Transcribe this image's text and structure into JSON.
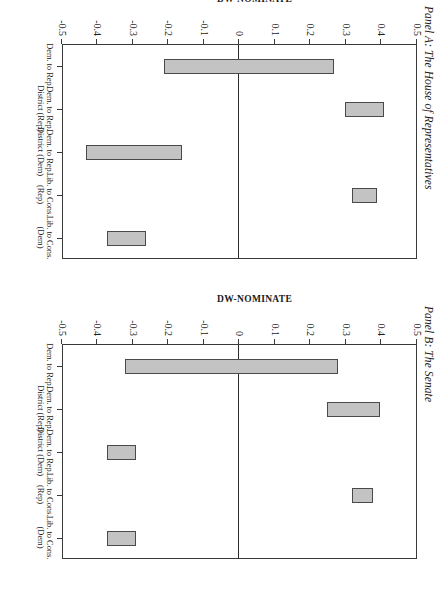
{
  "figure": {
    "axis_title": "DW-NOMINATE",
    "bar_fill_color": "#c3c3c3",
    "bar_border_color": "#4a4a4a",
    "frame_color": "#3a3a3a"
  },
  "chart_data": [
    {
      "type": "bar",
      "title": "Panel A: The House of Representatives",
      "xlabel": "",
      "ylabel": "DW-NOMINATE",
      "ylim": [
        -0.5,
        0.5
      ],
      "yticks": [
        0.5,
        0.4,
        0.3,
        0.2,
        0.1,
        0,
        -0.1,
        -0.2,
        -0.3,
        -0.4,
        -0.5
      ],
      "ytick_labels": [
        "0.5",
        "0.4",
        "0.3",
        "0.2",
        "0.1",
        "0",
        "-0.1",
        "-0.2",
        "-0.3",
        "-0.4",
        "-0.5"
      ],
      "grid": false,
      "legend": "none",
      "categories": [
        "Dem. to Rep.",
        "Dem. to Rep. District (Rep)",
        "Dem. to Rep. District (Dem)",
        "Lib. to Cons. (Rep)",
        "Lib. to Cons. (Dem)"
      ],
      "ranges": [
        {
          "category": "Dem. to Rep.",
          "low": -0.21,
          "high": 0.27
        },
        {
          "category": "Dem. to Rep. District (Rep)",
          "low": 0.3,
          "high": 0.41
        },
        {
          "category": "Dem. to Rep. District (Dem)",
          "low": -0.43,
          "high": -0.16
        },
        {
          "category": "Lib. to Cons. (Rep)",
          "low": 0.32,
          "high": 0.39
        },
        {
          "category": "Lib. to Cons. (Dem)",
          "low": -0.37,
          "high": -0.26
        }
      ]
    },
    {
      "type": "bar",
      "title": "Panel B: The Senate",
      "xlabel": "",
      "ylabel": "DW-NOMINATE",
      "ylim": [
        -0.5,
        0.5
      ],
      "yticks": [
        0.5,
        0.4,
        0.3,
        0.2,
        0.1,
        0,
        -0.1,
        -0.2,
        -0.3,
        -0.4,
        -0.5
      ],
      "ytick_labels": [
        "0.5",
        "0.4",
        "0.3",
        "0.2",
        "0.1",
        "0",
        "-0.1",
        "-0.2",
        "-0.3",
        "-0.4",
        "-0.5"
      ],
      "grid": false,
      "legend": "none",
      "categories": [
        "Dem. to Rep.",
        "Dem. to Rep. District (Rep)",
        "Dem. to Rep. District (Dem)",
        "Lib. to Cons. (Rep)",
        "Lib. to Cons. (Dem)"
      ],
      "ranges": [
        {
          "category": "Dem. to Rep.",
          "low": -0.32,
          "high": 0.28
        },
        {
          "category": "Dem. to Rep. District (Rep)",
          "low": 0.25,
          "high": 0.4
        },
        {
          "category": "Dem. to Rep. District (Dem)",
          "low": -0.37,
          "high": -0.29
        },
        {
          "category": "Lib. to Cons. (Rep)",
          "low": 0.32,
          "high": 0.38
        },
        {
          "category": "Lib. to Cons. (Dem)",
          "low": -0.37,
          "high": -0.29
        }
      ]
    }
  ]
}
